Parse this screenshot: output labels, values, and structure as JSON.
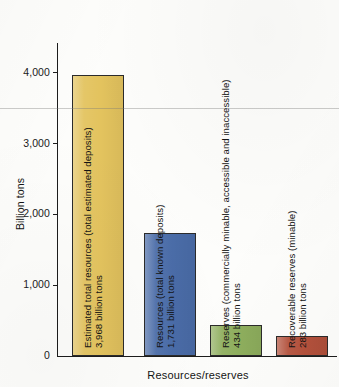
{
  "chart_data": {
    "type": "bar",
    "title": "",
    "xlabel": "Resources/reserves",
    "ylabel": "Billion tons",
    "ylim": [
      0,
      4500
    ],
    "yticks": [
      0,
      1000,
      2000,
      3000,
      4000
    ],
    "ytick_labels": [
      "0",
      "1,000",
      "2,000",
      "3,000",
      "4,000"
    ],
    "grid": false,
    "legend": null,
    "categories": [
      "Estimated total resources (total estimated deposits)",
      "Resources (total known deposits)",
      "Reserves (commercially minable, accessible and inaccessible)",
      "Recoverable reserves (minable)"
    ],
    "values": [
      3968,
      1731,
      434,
      283
    ],
    "value_labels": [
      "3,968 billion tons",
      "1,731 billion tons",
      "434 billion tons",
      "283 billion tons"
    ],
    "bar_captions": [
      "Estimated total resources (total estimated deposits)\n3,968 billion tons",
      "Resources (total known deposits)\n1,731 billion tons",
      "Reserves (commercially minable, accessible and inaccessible)\n434 billion tons",
      "Recoverable reserves (minable)\n283 billion tons"
    ],
    "colors": [
      "#e3c35e",
      "#4a6ca8",
      "#8faf5e",
      "#b4513c"
    ],
    "axis_color": "#1c1c1c",
    "background": "#fdfdfb"
  },
  "axis": {
    "y_title": "Billion tons",
    "x_title": "Resources/reserves",
    "ticks": [
      {
        "label": "4,000",
        "value": 4000
      },
      {
        "label": "3,000",
        "value": 3000
      },
      {
        "label": "2,000",
        "value": 2000
      },
      {
        "label": "1,000",
        "value": 1000
      },
      {
        "label": "0",
        "value": 0
      }
    ]
  },
  "bars": [
    {
      "caption": "Estimated total resources (total estimated deposits)\n3,968 billion tons",
      "name": "estimated-total-resources",
      "value": 3968,
      "color": "#e3c35e"
    },
    {
      "caption": "Resources (total known deposits)\n1,731 billion tons",
      "name": "resources-total-known-deposits",
      "value": 1731,
      "color": "#4a6ca8"
    },
    {
      "caption": "Reserves (commercially minable, accessible and inaccessible)\n434 billion tons",
      "name": "reserves-commercially-minable",
      "value": 434,
      "color": "#8faf5e"
    },
    {
      "caption": "Recoverable reserves (minable)\n283 billion tons",
      "name": "recoverable-reserves-minable",
      "value": 283,
      "color": "#b4513c"
    }
  ]
}
